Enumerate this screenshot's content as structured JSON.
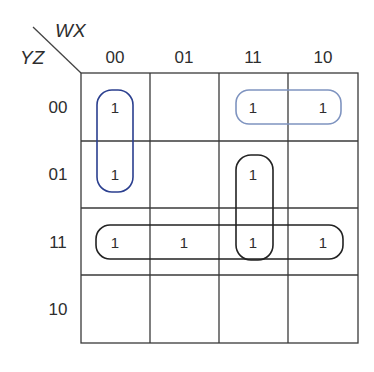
{
  "kmap": {
    "col_variables": "WX",
    "row_variables": "YZ",
    "col_headers": [
      "00",
      "01",
      "11",
      "10"
    ],
    "row_headers": [
      "00",
      "01",
      "11",
      "10"
    ],
    "cells": [
      [
        "1",
        "",
        "1",
        "1"
      ],
      [
        "1",
        "",
        "1",
        ""
      ],
      [
        "1",
        "1",
        "1",
        "1"
      ],
      [
        "",
        "",
        "",
        ""
      ]
    ],
    "groups": [
      {
        "name": "group-col00-rows00-01",
        "cells": [
          [
            0,
            0
          ],
          [
            1,
            0
          ]
        ],
        "color": "#2b3f8f"
      },
      {
        "name": "group-row00-cols11-10",
        "cells": [
          [
            0,
            2
          ],
          [
            0,
            3
          ]
        ],
        "color": "#7f94c0"
      },
      {
        "name": "group-col11-rows01-11",
        "cells": [
          [
            1,
            2
          ],
          [
            2,
            2
          ]
        ],
        "color": "#222222"
      },
      {
        "name": "group-row11-all",
        "cells": [
          [
            2,
            0
          ],
          [
            2,
            1
          ],
          [
            2,
            2
          ],
          [
            2,
            3
          ]
        ],
        "color": "#222222"
      }
    ]
  }
}
